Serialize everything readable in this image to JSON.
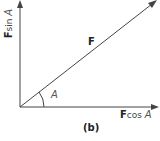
{
  "diagram": {
    "vector_label": "F",
    "angle_label": "A",
    "x_component": {
      "bold": "F",
      "rest": "cos ",
      "angle": "A"
    },
    "y_component": {
      "bold": "F",
      "rest": "sin ",
      "angle": "A"
    },
    "caption": "(b)",
    "colors": {
      "line": "#444444",
      "text": "#222222"
    }
  }
}
